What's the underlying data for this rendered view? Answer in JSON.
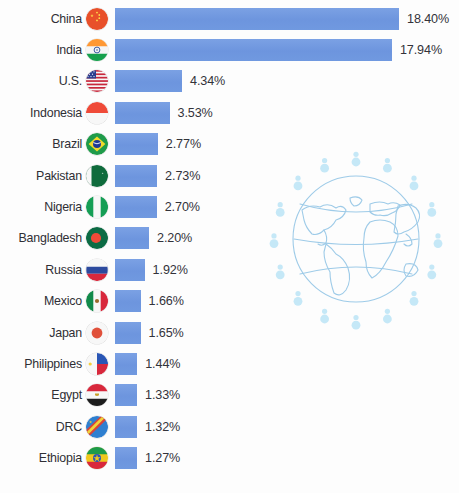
{
  "chart_data": {
    "type": "bar",
    "title": "",
    "xlabel": "",
    "ylabel": "",
    "orientation": "horizontal",
    "grid": false,
    "legend": "none",
    "value_suffix": "%",
    "xlim": [
      0,
      18.4
    ],
    "categories": [
      "China",
      "India",
      "U.S.",
      "Indonesia",
      "Brazil",
      "Pakistan",
      "Nigeria",
      "Bangladesh",
      "Russia",
      "Mexico",
      "Japan",
      "Philippines",
      "Egypt",
      "DRC",
      "Ethiopia"
    ],
    "values": [
      18.4,
      17.94,
      4.34,
      3.53,
      2.77,
      2.73,
      2.7,
      2.2,
      1.92,
      1.66,
      1.65,
      1.44,
      1.33,
      1.32,
      1.27
    ],
    "value_labels": [
      "18.40%",
      "17.94%",
      "4.34%",
      "3.53%",
      "2.77%",
      "2.73%",
      "2.70%",
      "2.20%",
      "1.92%",
      "1.66%",
      "1.65%",
      "1.44%",
      "1.33%",
      "1.32%",
      "1.27%"
    ],
    "series": [
      {
        "name": "Share of world population",
        "values": [
          18.4,
          17.94,
          4.34,
          3.53,
          2.77,
          2.73,
          2.7,
          2.2,
          1.92,
          1.66,
          1.65,
          1.44,
          1.33,
          1.32,
          1.27
        ]
      }
    ]
  },
  "rows": [
    {
      "label": "China",
      "value_label": "18.40%",
      "value": 18.4,
      "flag": "flag-china-icon"
    },
    {
      "label": "India",
      "value_label": "17.94%",
      "value": 17.94,
      "flag": "flag-india-icon"
    },
    {
      "label": "U.S.",
      "value_label": "4.34%",
      "value": 4.34,
      "flag": "flag-united-states-icon"
    },
    {
      "label": "Indonesia",
      "value_label": "3.53%",
      "value": 3.53,
      "flag": "flag-indonesia-icon"
    },
    {
      "label": "Brazil",
      "value_label": "2.77%",
      "value": 2.77,
      "flag": "flag-brazil-icon"
    },
    {
      "label": "Pakistan",
      "value_label": "2.73%",
      "value": 2.73,
      "flag": "flag-pakistan-icon"
    },
    {
      "label": "Nigeria",
      "value_label": "2.70%",
      "value": 2.7,
      "flag": "flag-nigeria-icon"
    },
    {
      "label": "Bangladesh",
      "value_label": "2.20%",
      "value": 2.2,
      "flag": "flag-bangladesh-icon"
    },
    {
      "label": "Russia",
      "value_label": "1.92%",
      "value": 1.92,
      "flag": "flag-russia-icon"
    },
    {
      "label": "Mexico",
      "value_label": "1.66%",
      "value": 1.66,
      "flag": "flag-mexico-icon"
    },
    {
      "label": "Japan",
      "value_label": "1.65%",
      "value": 1.65,
      "flag": "flag-japan-icon"
    },
    {
      "label": "Philippines",
      "value_label": "1.44%",
      "value": 1.44,
      "flag": "flag-philippines-icon"
    },
    {
      "label": "Egypt",
      "value_label": "1.33%",
      "value": 1.33,
      "flag": "flag-egypt-icon"
    },
    {
      "label": "DRC",
      "value_label": "1.32%",
      "value": 1.32,
      "flag": "flag-drc-icon"
    },
    {
      "label": "Ethiopia",
      "value_label": "1.27%",
      "value": 1.27,
      "flag": "flag-ethiopia-icon"
    }
  ],
  "decoration": {
    "globe_icon": "globe-with-people-icon",
    "people_count": 16
  },
  "colors": {
    "bar": "#7099e0",
    "label_text": "#2f2f35",
    "value_text": "#33333a",
    "background": "#fdfdfd",
    "globe_line": "#9ecbe8",
    "globe_people": "#bfe6f7"
  }
}
